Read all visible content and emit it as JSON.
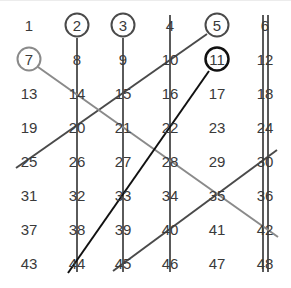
{
  "grid": {
    "columns": 6,
    "rows": 8,
    "col_x": [
      29,
      77,
      123,
      170,
      217,
      265
    ],
    "row_y": [
      25,
      59,
      93,
      127,
      161,
      195,
      229,
      263
    ],
    "numbers": [
      [
        "1",
        "2",
        "3",
        "4",
        "5",
        "6"
      ],
      [
        "7",
        "8",
        "9",
        "10",
        "11",
        "12"
      ],
      [
        "13",
        "14",
        "15",
        "16",
        "17",
        "18"
      ],
      [
        "19",
        "20",
        "21",
        "22",
        "23",
        "24"
      ],
      [
        "25",
        "26",
        "27",
        "28",
        "29",
        "30"
      ],
      [
        "31",
        "32",
        "33",
        "34",
        "35",
        "36"
      ],
      [
        "37",
        "38",
        "39",
        "40",
        "41",
        "42"
      ],
      [
        "43",
        "44",
        "45",
        "46",
        "47",
        "48"
      ]
    ]
  },
  "primes_circled": [
    {
      "value": "2",
      "col": 1,
      "row": 0,
      "color": "#4a4a4a",
      "width": 2
    },
    {
      "value": "3",
      "col": 2,
      "row": 0,
      "color": "#4a4a4a",
      "width": 2
    },
    {
      "value": "5",
      "col": 4,
      "row": 0,
      "color": "#4a4a4a",
      "width": 2
    },
    {
      "value": "7",
      "col": 0,
      "row": 1,
      "color": "#8a8a8a",
      "width": 2
    },
    {
      "value": "11",
      "col": 4,
      "row": 1,
      "color": "#111111",
      "width": 2.5
    }
  ],
  "strike_lines": [
    {
      "name": "multiples-of-2",
      "x1": 77,
      "y1": 38,
      "x2": 77,
      "y2": 272,
      "color": "#5a5a5a",
      "width": 2
    },
    {
      "name": "multiples-of-3",
      "x1": 123,
      "y1": 38,
      "x2": 123,
      "y2": 272,
      "color": "#5a5a5a",
      "width": 2
    },
    {
      "name": "multiples-of-2-col4",
      "x1": 170,
      "y1": 15,
      "x2": 170,
      "y2": 272,
      "color": "#5a5a5a",
      "width": 2
    },
    {
      "name": "multiples-of-2-col6",
      "x1": 263,
      "y1": 15,
      "x2": 263,
      "y2": 272,
      "color": "#5a5a5a",
      "width": 2
    },
    {
      "name": "multiples-of-3-col6",
      "x1": 268,
      "y1": 15,
      "x2": 268,
      "y2": 272,
      "color": "#5a5a5a",
      "width": 2
    },
    {
      "name": "multiples-of-5-a",
      "x1": 207,
      "y1": 34,
      "x2": 16,
      "y2": 168,
      "color": "#4a4a4a",
      "width": 2
    },
    {
      "name": "multiples-of-5-b",
      "x1": 277,
      "y1": 150,
      "x2": 113,
      "y2": 271,
      "color": "#4a4a4a",
      "width": 2
    },
    {
      "name": "multiples-of-7",
      "x1": 38,
      "y1": 67,
      "x2": 278,
      "y2": 237,
      "color": "#8a8a8a",
      "width": 2
    },
    {
      "name": "multiples-of-11",
      "x1": 209,
      "y1": 71,
      "x2": 68,
      "y2": 273,
      "color": "#111111",
      "width": 2
    }
  ]
}
